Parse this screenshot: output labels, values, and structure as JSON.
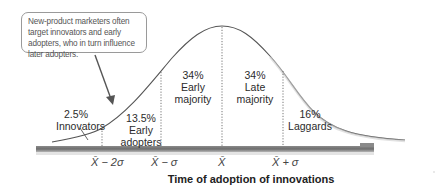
{
  "callout": {
    "text": "New-product marketers often target innovators and early adopters, who in turn influence later adopters."
  },
  "segments": [
    {
      "percent": "2.5%",
      "name": "Innovators",
      "color": "#9a9a9a"
    },
    {
      "percent": "13.5%",
      "name": "Early adopters",
      "name_line1": "Early",
      "name_line2": "adopters",
      "color": "#9a9a9a"
    },
    {
      "percent": "34%",
      "name": "Early majority",
      "name_line1": "Early",
      "name_line2": "majority",
      "color": "#2b2b2b"
    },
    {
      "percent": "34%",
      "name": "Late majority",
      "name_line1": "Late",
      "name_line2": "majority",
      "color": "#2b2b2b"
    },
    {
      "percent": "16%",
      "name": "Laggards",
      "color": "#2b2b2b"
    }
  ],
  "axis": {
    "ticks": [
      "X̄ − 2σ",
      "X̄ − σ",
      "X̄",
      "X̄ + σ"
    ],
    "title": "Time of adoption of innovations"
  },
  "colors": {
    "curve": "#555555",
    "axis_bar": "#7a7a7a",
    "divider": "#666666",
    "arrow": "#555555"
  }
}
